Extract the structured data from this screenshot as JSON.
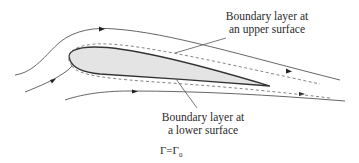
{
  "diagram": {
    "labels": {
      "upper_line1": "Boundary layer at",
      "upper_line2": "an upper surface",
      "lower_line1": "Boundary layer at",
      "lower_line2": "a lower surface",
      "circulation_lhs": "Γ",
      "circulation_eq": "=",
      "circulation_rhs": "Γ",
      "circulation_sub": "0"
    },
    "colors": {
      "airfoil_fill": "#e4e4e4",
      "airfoil_stroke": "#333333",
      "streamline": "#555555",
      "dashed": "#666666",
      "text": "#2a2a2a"
    },
    "elements": {
      "airfoil": "thin cambered airfoil body",
      "streamlines": 3,
      "boundary_layer_outline": "dashed"
    }
  }
}
